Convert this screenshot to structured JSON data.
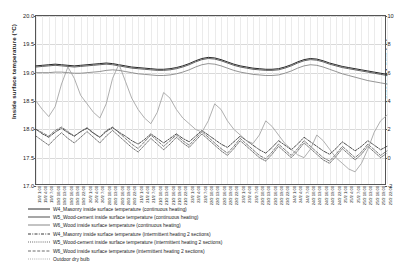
{
  "chart_data": {
    "type": "line",
    "title": "",
    "xlabel": "",
    "ylabel": "Inside surface temperature (°C)",
    "y2label": "Outdoor dry bulb (°C)",
    "ylim": [
      17.0,
      20.0
    ],
    "yticks": [
      "17.0",
      "17.5",
      "18.0",
      "18.5",
      "19.0",
      "19.5",
      "20.0"
    ],
    "y2lim": [
      -2,
      10
    ],
    "y2ticks": [
      "-2",
      "0",
      "2",
      "4",
      "6",
      "8",
      "10"
    ],
    "grid": true,
    "legend_position": "below",
    "x": [
      "19/2 1:00",
      "19/2 4:00",
      "19/2 7:00",
      "19/2 10:00",
      "19/2 13:00",
      "19/2 16:00",
      "19/2 19:00",
      "19/2 22:00",
      "20/2 1:00",
      "20/2 4:00",
      "20/2 7:00",
      "20/2 10:00",
      "20/2 13:00",
      "20/2 16:00",
      "20/2 19:00",
      "20/2 22:00",
      "21/2 1:00",
      "21/2 4:00",
      "21/2 7:00",
      "21/2 10:00",
      "21/2 13:00",
      "21/2 16:00",
      "21/2 19:00",
      "21/2 22:00",
      "22/2 1:00",
      "22/2 4:00",
      "22/2 7:00",
      "22/2 10:00",
      "22/2 13:00",
      "22/2 16:00",
      "22/2 19:00",
      "22/2 22:00",
      "23/2 1:00",
      "23/2 4:00",
      "23/2 7:00",
      "23/2 10:00",
      "23/2 13:00",
      "23/2 16:00",
      "23/2 19:00",
      "23/2 22:00",
      "24/2 1:00",
      "24/2 4:00",
      "24/2 7:00",
      "24/2 10:00",
      "24/2 13:00",
      "24/2 16:00",
      "24/2 19:00",
      "24/2 22:00",
      "25/2 1:00",
      "25/2 4:00",
      "25/2 7:00",
      "25/2 10:00",
      "25/2 13:00",
      "25/2 16:00",
      "25/2 19:00",
      "25/2 22:00"
    ],
    "series": [
      {
        "name": "W4_Masonry inside surface temperature (continuous heating)",
        "axis": "left",
        "style": "solid",
        "color": "#111111",
        "width": 0.9,
        "values": [
          19.12,
          19.13,
          19.14,
          19.15,
          19.14,
          19.13,
          19.12,
          19.13,
          19.14,
          19.15,
          19.16,
          19.17,
          19.16,
          19.14,
          19.12,
          19.1,
          19.09,
          19.08,
          19.07,
          19.06,
          19.06,
          19.07,
          19.09,
          19.12,
          19.16,
          19.21,
          19.25,
          19.27,
          19.26,
          19.23,
          19.19,
          19.15,
          19.12,
          19.1,
          19.08,
          19.07,
          19.06,
          19.06,
          19.07,
          19.1,
          19.14,
          19.19,
          19.23,
          19.25,
          19.24,
          19.21,
          19.17,
          19.14,
          19.11,
          19.09,
          19.07,
          19.05,
          19.03,
          19.01,
          18.99,
          18.97
        ]
      },
      {
        "name": "W5_Wood-cement inside surface temperature (continuous heating)",
        "axis": "left",
        "style": "solid",
        "color": "#3b3b3b",
        "width": 0.8,
        "values": [
          19.1,
          19.11,
          19.12,
          19.13,
          19.12,
          19.11,
          19.1,
          19.11,
          19.12,
          19.13,
          19.14,
          19.15,
          19.14,
          19.12,
          19.1,
          19.08,
          19.07,
          19.06,
          19.05,
          19.04,
          19.04,
          19.05,
          19.07,
          19.1,
          19.14,
          19.19,
          19.23,
          19.25,
          19.24,
          19.21,
          19.17,
          19.13,
          19.1,
          19.08,
          19.06,
          19.05,
          19.04,
          19.04,
          19.05,
          19.08,
          19.12,
          19.17,
          19.21,
          19.23,
          19.22,
          19.19,
          19.15,
          19.12,
          19.09,
          19.07,
          19.05,
          19.03,
          19.01,
          18.99,
          18.97,
          18.95
        ]
      },
      {
        "name": "W6_Wood inside surface temperature (continuous heating)",
        "axis": "left",
        "style": "solid",
        "color": "#7a7a7a",
        "width": 0.8,
        "values": [
          19.0,
          19.0,
          19.0,
          19.01,
          19.01,
          19.0,
          18.99,
          18.99,
          19.0,
          19.01,
          19.02,
          19.04,
          19.05,
          19.04,
          19.02,
          19.0,
          18.98,
          18.97,
          18.96,
          18.95,
          18.95,
          18.96,
          18.98,
          19.01,
          19.05,
          19.1,
          19.14,
          19.16,
          19.15,
          19.12,
          19.08,
          19.04,
          19.01,
          18.99,
          18.97,
          18.96,
          18.95,
          18.95,
          18.96,
          18.99,
          19.03,
          19.08,
          19.12,
          19.14,
          19.13,
          19.1,
          19.06,
          19.02,
          18.98,
          18.95,
          18.92,
          18.89,
          18.86,
          18.84,
          18.82,
          18.8
        ]
      },
      {
        "name": "W4_Masonry inside surface temperature (intermittent heating 2 sections)",
        "axis": "left",
        "style": "dashdot",
        "color": "#222222",
        "width": 0.8,
        "values": [
          18.0,
          17.92,
          17.86,
          17.95,
          18.02,
          17.94,
          17.88,
          17.96,
          18.02,
          17.93,
          17.86,
          17.96,
          18.03,
          17.95,
          17.88,
          17.8,
          17.74,
          17.82,
          17.92,
          17.84,
          17.76,
          17.84,
          17.92,
          17.84,
          17.78,
          17.88,
          17.98,
          17.9,
          17.82,
          17.74,
          17.68,
          17.78,
          17.88,
          17.8,
          17.72,
          17.64,
          17.58,
          17.68,
          17.8,
          17.72,
          17.64,
          17.74,
          17.86,
          17.78,
          17.7,
          17.62,
          17.56,
          17.66,
          17.78,
          17.7,
          17.62,
          17.7,
          17.8,
          17.72,
          17.64,
          17.7
        ]
      },
      {
        "name": "W5_Wood-cement inside surface temperature (intermittent heating 2 sections)",
        "axis": "left",
        "style": "dotted",
        "color": "#4a4a4a",
        "width": 0.8,
        "values": [
          17.88,
          17.8,
          17.72,
          17.84,
          17.94,
          17.84,
          17.76,
          17.86,
          17.96,
          17.86,
          17.76,
          17.88,
          17.98,
          17.88,
          17.78,
          17.68,
          17.6,
          17.72,
          17.84,
          17.74,
          17.64,
          17.74,
          17.86,
          17.76,
          17.68,
          17.8,
          17.92,
          17.82,
          17.72,
          17.62,
          17.54,
          17.66,
          17.8,
          17.7,
          17.6,
          17.5,
          17.44,
          17.56,
          17.7,
          17.6,
          17.5,
          17.62,
          17.76,
          17.66,
          17.56,
          17.46,
          17.4,
          17.52,
          17.66,
          17.56,
          17.46,
          17.56,
          17.7,
          17.6,
          17.5,
          17.58
        ]
      },
      {
        "name": "W6_Wood inside surface temperature (intermittent heating 2 sections)",
        "axis": "left",
        "style": "dashed",
        "color": "#5c5c5c",
        "width": 0.8,
        "values": [
          18.0,
          17.94,
          17.88,
          17.98,
          18.04,
          17.96,
          17.88,
          17.96,
          18.03,
          17.94,
          17.86,
          17.98,
          18.04,
          17.94,
          17.84,
          17.74,
          17.66,
          17.78,
          17.9,
          17.8,
          17.7,
          17.8,
          17.9,
          17.8,
          17.72,
          17.84,
          17.96,
          17.86,
          17.76,
          17.66,
          17.58,
          17.7,
          17.84,
          17.74,
          17.64,
          17.54,
          17.48,
          17.6,
          17.74,
          17.64,
          17.54,
          17.66,
          17.8,
          17.7,
          17.6,
          17.5,
          17.44,
          17.56,
          17.7,
          17.6,
          17.5,
          17.6,
          17.74,
          17.64,
          17.54,
          17.62
        ]
      },
      {
        "name": "Outdoor dry bulb",
        "axis": "right",
        "style": "solid",
        "color": "#9a9a9a",
        "width": 0.8,
        "values": [
          4.0,
          3.4,
          2.9,
          3.6,
          5.2,
          6.4,
          5.6,
          4.4,
          3.8,
          3.2,
          2.8,
          3.8,
          5.6,
          6.6,
          5.4,
          4.2,
          3.4,
          2.8,
          2.4,
          3.2,
          4.6,
          4.2,
          3.4,
          2.8,
          2.4,
          2.0,
          1.8,
          2.6,
          3.8,
          3.4,
          2.6,
          2.0,
          1.6,
          1.2,
          1.0,
          1.6,
          2.6,
          2.2,
          1.6,
          1.0,
          0.6,
          0.2,
          0.0,
          0.6,
          1.6,
          1.2,
          0.6,
          0.0,
          -0.4,
          -0.8,
          -1.0,
          -0.4,
          0.6,
          1.8,
          2.6,
          3.0
        ]
      }
    ]
  },
  "legend": {
    "items": [
      {
        "label": "W4_Masonry inside surface temperature (continuous heating)",
        "style": "solid"
      },
      {
        "label": "W5_Wood-cement inside surface temperature (continuous heating)",
        "style": "solid"
      },
      {
        "label": "W6_Wood inside surface temperature (continuous heating)",
        "style": "solid"
      },
      {
        "label": "W4_Masonry inside surface temperature (intermittent heating 2 sections)",
        "style": "dashdot"
      },
      {
        "label": "W5_Wood-cement inside surface temperature (intermittent heating 2 sections)",
        "style": "dotted"
      },
      {
        "label": "W6_Wood inside surface temperature (intermittent heating 2 sections)",
        "style": "dashed"
      },
      {
        "label": "Outdoor dry bulb",
        "style": "dotted"
      }
    ]
  }
}
